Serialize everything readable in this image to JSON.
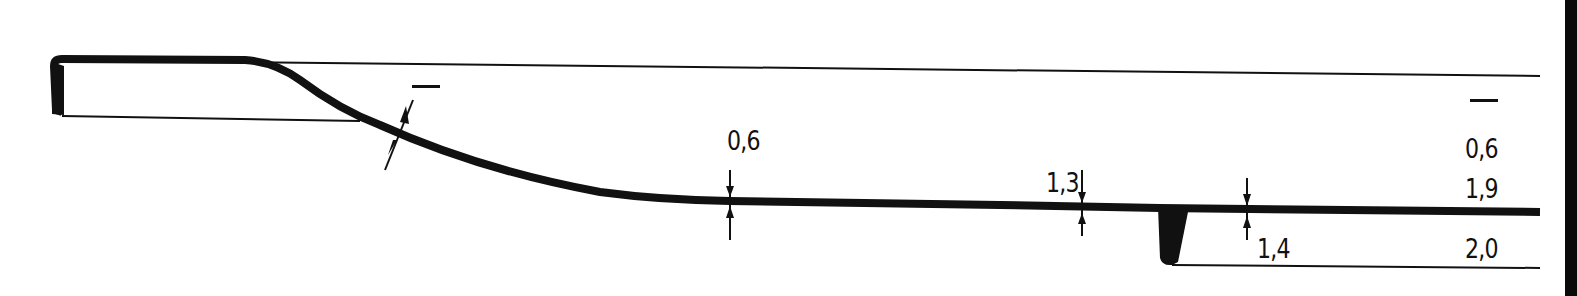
{
  "drawing": {
    "type": "cross-section profile",
    "line_color": "#111111",
    "background": "#ffffff"
  },
  "labels": {
    "slope_dash": "—",
    "mid_thickness": "0,6",
    "right_thickness": "1,3",
    "rib_thickness": "1,4",
    "col_dash": "—",
    "col_top": "0,6",
    "col_mid": "1,9",
    "col_bottom": "2,0"
  }
}
